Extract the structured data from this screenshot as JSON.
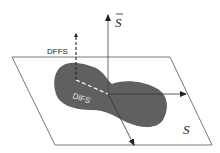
{
  "diagram": {
    "type": "subspace-projection",
    "labels": {
      "dffs": "DFFS",
      "difs": "DIFS",
      "plane": "S",
      "orthogonal": "S"
    },
    "colors": {
      "line": "#333333",
      "plane_edge": "#555555",
      "blob": "#606060",
      "dashed": "#ffffff",
      "text": "#222222"
    },
    "elements": [
      {
        "name": "plane-S",
        "description": "parallelogram subspace plane"
      },
      {
        "name": "data-manifold",
        "description": "dark gray blob lying in plane"
      },
      {
        "name": "axis-orthogonal",
        "description": "vertical arrow labeled S-bar"
      },
      {
        "name": "axis-horizontal",
        "description": "arrow in plane pointing right"
      },
      {
        "name": "axis-diagonal",
        "description": "arrow in plane pointing down-right"
      },
      {
        "name": "dffs-distance",
        "description": "dashed vertical line, distance from feature space"
      },
      {
        "name": "difs-distance",
        "description": "dashed line in plane, distance in feature space"
      }
    ]
  }
}
